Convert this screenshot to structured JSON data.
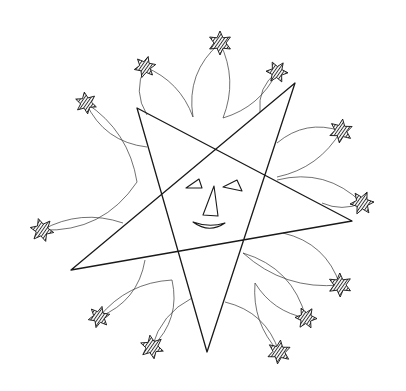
{
  "colors": {
    "background": "#ffffff",
    "ink": "#1a1a1a",
    "hatch": "#2a2a2a"
  },
  "main_star": {
    "points": [
      [
        137,
        108
      ],
      [
        207,
        352
      ],
      [
        295,
        83
      ],
      [
        71,
        270
      ],
      [
        352,
        221
      ]
    ],
    "stroke_width": 1.3
  },
  "face": {
    "left_eye": [
      [
        186,
        188
      ],
      [
        199,
        179
      ],
      [
        202,
        188
      ]
    ],
    "right_eye": [
      [
        223,
        187
      ],
      [
        237,
        180
      ],
      [
        242,
        191
      ]
    ],
    "nose": [
      [
        203,
        215
      ],
      [
        214,
        186
      ],
      [
        218,
        216
      ]
    ],
    "smile": {
      "start": [
        193,
        222
      ],
      "control": [
        209,
        234
      ],
      "end": [
        225,
        223
      ],
      "inner_control": [
        209,
        228
      ]
    }
  },
  "shooting_stars": [
    {
      "c": [
        220,
        43
      ],
      "r": 12,
      "trails": [
        [
          193,
          117
        ],
        [
          223,
          118
        ]
      ]
    },
    {
      "c": [
        145,
        67
      ],
      "r": 11,
      "trails": [
        [
          147,
          115
        ],
        [
          193,
          117
        ]
      ]
    },
    {
      "c": [
        277,
        72
      ],
      "r": 11,
      "trails": [
        [
          260,
          112
        ],
        [
          223,
          118
        ]
      ]
    },
    {
      "c": [
        86,
        103
      ],
      "r": 11,
      "trails": [
        [
          147,
          147
        ],
        [
          137,
          182
        ]
      ]
    },
    {
      "c": [
        341,
        131
      ],
      "r": 12,
      "trails": [
        [
          277,
          143
        ],
        [
          277,
          177
        ]
      ]
    },
    {
      "c": [
        362,
        203
      ],
      "r": 12,
      "trails": [
        [
          277,
          180
        ],
        [
          322,
          203
        ]
      ]
    },
    {
      "c": [
        42,
        230
      ],
      "r": 12,
      "trails": [
        [
          137,
          182
        ],
        [
          123,
          223
        ]
      ]
    },
    {
      "c": [
        340,
        285
      ],
      "r": 12,
      "trails": [
        [
          283,
          233
        ],
        [
          243,
          253
        ]
      ]
    },
    {
      "c": [
        99,
        317
      ],
      "r": 11,
      "trails": [
        [
          145,
          260
        ],
        [
          172,
          280
        ]
      ]
    },
    {
      "c": [
        306,
        318
      ],
      "r": 11,
      "trails": [
        [
          243,
          253
        ],
        [
          255,
          283
        ]
      ]
    },
    {
      "c": [
        152,
        347
      ],
      "r": 12,
      "trails": [
        [
          172,
          280
        ],
        [
          192,
          298
        ]
      ]
    },
    {
      "c": [
        279,
        352
      ],
      "r": 12,
      "trails": [
        [
          225,
          302
        ],
        [
          255,
          283
        ]
      ]
    }
  ]
}
